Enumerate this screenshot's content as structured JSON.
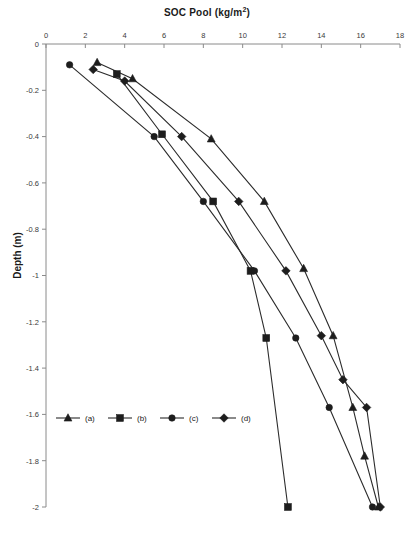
{
  "chart_data": {
    "type": "line",
    "title": "SOC Pool (kg/m2)",
    "title_main": "SOC Pool (kg/m",
    "title_sup": "2",
    "title_tail": ")",
    "xlabel": "SOC Pool (kg/m2)",
    "ylabel": "Depth (m)",
    "xlim": [
      0,
      18
    ],
    "ylim": [
      -2,
      0
    ],
    "xticks": [
      0,
      2,
      4,
      6,
      8,
      10,
      12,
      14,
      16,
      18
    ],
    "xtick_labels": [
      "0",
      "2",
      "4",
      "6",
      "8",
      "10",
      "12",
      "14",
      "16",
      "18"
    ],
    "yticks": [
      0,
      -0.2,
      -0.4,
      -0.6,
      -0.8,
      -1,
      -1.2,
      -1.4,
      -1.6,
      -1.8,
      -2
    ],
    "ytick_labels": [
      "0",
      "-0.2",
      "-0.4",
      "-0.6",
      "-0.8",
      "-1",
      "-1.2",
      "-1.4",
      "-1.6",
      "-1.8",
      "-2"
    ],
    "grid": false,
    "axis_position": "x-axis on top, y-axis depth increasing downward",
    "legend_position": "inside lower-left",
    "series": [
      {
        "name": "(a)",
        "marker": "triangle",
        "color": "#1d1d1d",
        "points": [
          {
            "x": 2.6,
            "y": -0.08
          },
          {
            "x": 4.4,
            "y": -0.15
          },
          {
            "x": 8.4,
            "y": -0.41
          },
          {
            "x": 11.1,
            "y": -0.68
          },
          {
            "x": 13.1,
            "y": -0.97
          },
          {
            "x": 14.6,
            "y": -1.26
          },
          {
            "x": 15.6,
            "y": -1.57
          },
          {
            "x": 16.2,
            "y": -1.78
          },
          {
            "x": 16.9,
            "y": -2.0
          }
        ]
      },
      {
        "name": "(b)",
        "marker": "square",
        "color": "#1d1d1d",
        "points": [
          {
            "x": 3.6,
            "y": -0.13
          },
          {
            "x": 5.9,
            "y": -0.39
          },
          {
            "x": 8.5,
            "y": -0.68
          },
          {
            "x": 10.4,
            "y": -0.98
          },
          {
            "x": 11.2,
            "y": -1.27
          },
          {
            "x": 12.3,
            "y": -2.0
          }
        ]
      },
      {
        "name": "(c)",
        "marker": "circle",
        "color": "#1d1d1d",
        "points": [
          {
            "x": 1.2,
            "y": -0.09
          },
          {
            "x": 5.5,
            "y": -0.4
          },
          {
            "x": 8.0,
            "y": -0.68
          },
          {
            "x": 10.6,
            "y": -0.98
          },
          {
            "x": 12.7,
            "y": -1.27
          },
          {
            "x": 14.4,
            "y": -1.57
          },
          {
            "x": 16.6,
            "y": -2.0
          }
        ]
      },
      {
        "name": "(d)",
        "marker": "diamond",
        "color": "#1d1d1d",
        "points": [
          {
            "x": 2.4,
            "y": -0.11
          },
          {
            "x": 4.0,
            "y": -0.16
          },
          {
            "x": 6.9,
            "y": -0.4
          },
          {
            "x": 9.8,
            "y": -0.68
          },
          {
            "x": 12.2,
            "y": -0.98
          },
          {
            "x": 14.0,
            "y": -1.26
          },
          {
            "x": 15.1,
            "y": -1.45
          },
          {
            "x": 16.3,
            "y": -1.57
          },
          {
            "x": 17.0,
            "y": -2.0
          }
        ]
      }
    ],
    "legend": [
      {
        "label": "(a)",
        "marker": "triangle"
      },
      {
        "label": "(b)",
        "marker": "square"
      },
      {
        "label": "(c)",
        "marker": "circle"
      },
      {
        "label": "(d)",
        "marker": "diamond"
      }
    ]
  }
}
